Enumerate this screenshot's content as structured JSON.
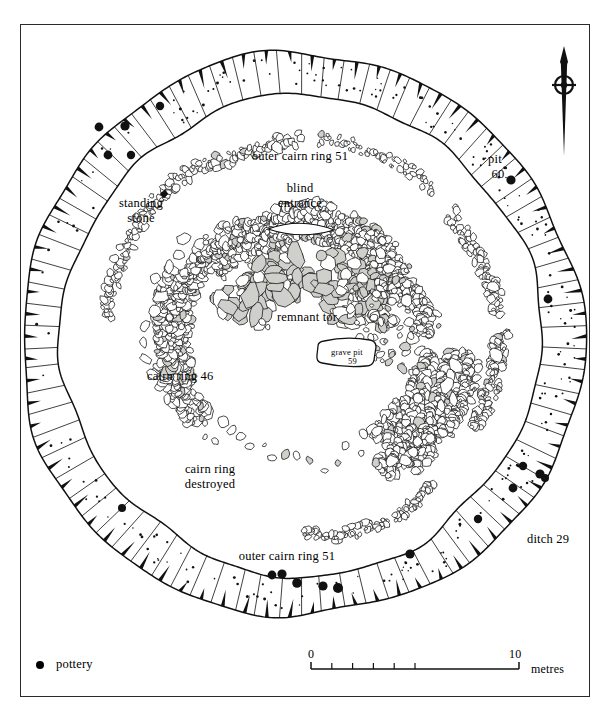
{
  "figure": {
    "kind": "archaeological-site-plan",
    "frame": {
      "stroke": "#2a2a2a"
    }
  },
  "labels": {
    "outer_cairn_ring_top": "outer cairn ring 51",
    "outer_cairn_ring_bottom": "outer cairn ring 51",
    "blind_entrance_line1": "blind",
    "blind_entrance_line2": "entrance",
    "standing_stone_line1": "standing",
    "standing_stone_line2": "stone",
    "remnant_tor": "remnant tor",
    "cairn_ring_46": "cairn ring 46",
    "cairn_ring_destroyed_line1": "cairn ring",
    "cairn_ring_destroyed_line2": "destroyed",
    "grave_pit_line1": "grave pit",
    "grave_pit_line2": "59",
    "pit_line1": "pit",
    "pit_line2": "60",
    "ditch": "ditch 29"
  },
  "legend": {
    "symbol": "filled-circle",
    "label": "pottery"
  },
  "scalebar": {
    "min": "0",
    "max": "10",
    "unit": "metres",
    "minor_ticks": 5
  },
  "north_arrow": {
    "icon": "north-arrow-icon"
  },
  "colors": {
    "ink": "#111111",
    "stone_fill": "#cfcfcb",
    "paper": "#ffffff"
  }
}
